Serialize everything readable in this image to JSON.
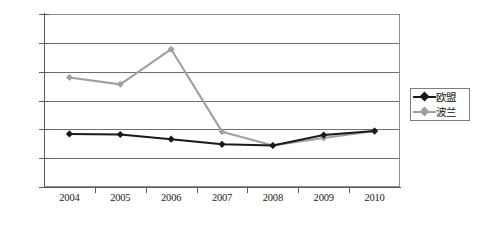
{
  "chart_data": {
    "type": "line",
    "title": "",
    "xlabel": "",
    "ylabel": "",
    "categories": [
      "2004",
      "2005",
      "2006",
      "2007",
      "2008",
      "2009",
      "2010"
    ],
    "ylim": [
      0,
      30
    ],
    "ytick_labels": [
      "0.0%",
      "5.0%",
      "10.0%",
      "15.0%",
      "20.0%",
      "25.0%",
      "30.0%"
    ],
    "ytick_values": [
      0,
      5,
      10,
      15,
      20,
      25,
      30
    ],
    "grid": true,
    "legend_position": "right",
    "series": [
      {
        "name": "欧盟",
        "color": "#1a1a1a",
        "marker": "diamond",
        "values": [
          9.2,
          9.1,
          8.3,
          7.4,
          7.2,
          9.0,
          9.7
        ]
      },
      {
        "name": "波兰",
        "color": "#a0a0a0",
        "marker": "diamond",
        "values": [
          19.0,
          17.8,
          23.9,
          9.6,
          7.2,
          8.5,
          9.7
        ]
      }
    ]
  },
  "legend": {
    "items": [
      {
        "label": "欧盟"
      },
      {
        "label": "波兰"
      }
    ]
  },
  "axes": {
    "y_labels": [
      "30.0%",
      "25.0%",
      "20.0%",
      "15.0%",
      "10.0%",
      "5.0%",
      "0.0%"
    ],
    "x_labels": [
      "2004",
      "2005",
      "2006",
      "2007",
      "2008",
      "2009",
      "2010"
    ]
  },
  "caption": {
    "text": ""
  },
  "colors": {
    "series_eu": "#1a1a1a",
    "series_poland": "#a0a0a0",
    "gridline": "#6e6e6e",
    "axis": "#5a5a5a",
    "plot_border": "#8c8c8c",
    "background": "#ffffff"
  }
}
